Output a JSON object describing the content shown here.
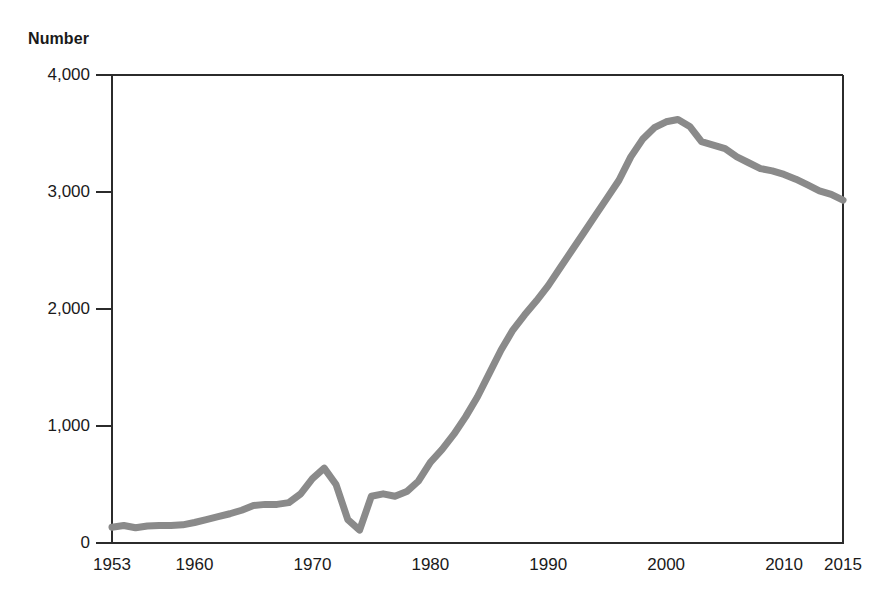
{
  "chart_data": {
    "type": "line",
    "title": "",
    "ylabel": "Number",
    "xlabel": "",
    "ylim": [
      0,
      4000
    ],
    "xlim": [
      1953,
      2015
    ],
    "grid": false,
    "legend": null,
    "y_ticks": [
      0,
      1000,
      2000,
      3000,
      4000
    ],
    "y_tick_labels": [
      "0",
      "1,000",
      "2,000",
      "3,000",
      "4,000"
    ],
    "x_ticks": [
      1953,
      1960,
      1970,
      1980,
      1990,
      2000,
      2010,
      2015
    ],
    "x_tick_labels": [
      "1953",
      "1960",
      "1970",
      "1980",
      "1990",
      "2000",
      "2010",
      "2015"
    ],
    "line_color": "#8a8a8a",
    "line_width": 7,
    "series": [
      {
        "name": "Number",
        "x": [
          1953,
          1954,
          1955,
          1956,
          1957,
          1958,
          1959,
          1960,
          1961,
          1962,
          1963,
          1964,
          1965,
          1966,
          1967,
          1968,
          1969,
          1970,
          1971,
          1972,
          1973,
          1974,
          1975,
          1976,
          1977,
          1978,
          1979,
          1980,
          1981,
          1982,
          1983,
          1984,
          1985,
          1986,
          1987,
          1988,
          1989,
          1990,
          1991,
          1992,
          1993,
          1994,
          1995,
          1996,
          1997,
          1998,
          1999,
          2000,
          2001,
          2002,
          2003,
          2004,
          2005,
          2006,
          2007,
          2008,
          2009,
          2010,
          2011,
          2012,
          2013,
          2014,
          2015
        ],
        "values": [
          135,
          150,
          130,
          145,
          150,
          150,
          155,
          175,
          200,
          225,
          250,
          280,
          320,
          330,
          330,
          345,
          420,
          550,
          640,
          500,
          200,
          110,
          400,
          420,
          400,
          440,
          530,
          690,
          800,
          930,
          1080,
          1250,
          1450,
          1650,
          1820,
          1950,
          2070,
          2200,
          2350,
          2500,
          2650,
          2800,
          2950,
          3100,
          3300,
          3450,
          3550,
          3600,
          3620,
          3560,
          3430,
          3400,
          3370,
          3300,
          3250,
          3200,
          3180,
          3150,
          3110,
          3060,
          3010,
          2980,
          2930
        ]
      }
    ]
  },
  "labels": {
    "y_axis_title": "Number"
  }
}
